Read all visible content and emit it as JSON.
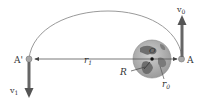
{
  "diagram": {
    "type": "orbit-transfer",
    "labels": {
      "A": "A",
      "A_prime": "A'",
      "O": "O",
      "r1": "r",
      "r1_sub": "1",
      "r0": "r",
      "r0_sub": "0",
      "R": "R",
      "v0": "v",
      "v0_sub": "0",
      "v1": "v",
      "v1_sub": "1"
    },
    "colors": {
      "orbit": "#9a9a9a",
      "arrow": "#666666",
      "line": "#555555",
      "earth_ocean": "#b9b9b9",
      "earth_land": "#6e6e6e",
      "point": "#a0a0a0",
      "text": "#333333"
    }
  }
}
